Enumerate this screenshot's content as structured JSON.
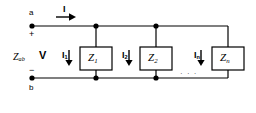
{
  "diagram": {
    "stroke_color": "#000000",
    "background": "#ffffff",
    "terminals": {
      "top": "a",
      "bottom": "b",
      "polarity_plus": "+",
      "polarity_minus": "−"
    },
    "equivalent_impedance_label": "Z",
    "equivalent_impedance_sub": "ab",
    "voltage_label": "V",
    "source_current": {
      "label": "I",
      "sub": "",
      "arrow": "right-arrow-icon"
    },
    "branches": [
      {
        "current_label": "I",
        "current_sub": "1",
        "impedance_label": "Z",
        "impedance_sub": "1",
        "arrow": "down-arrow-icon"
      },
      {
        "current_label": "I",
        "current_sub": "2",
        "impedance_label": "Z",
        "impedance_sub": "2",
        "arrow": "down-arrow-icon"
      },
      {
        "current_label": "I",
        "current_sub": "n",
        "impedance_label": "Z",
        "impedance_sub": "n",
        "arrow": "down-arrow-icon"
      }
    ],
    "ellipsis": "· · ·"
  }
}
